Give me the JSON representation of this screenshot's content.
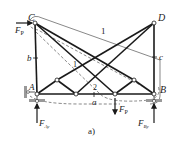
{
  "figure": {
    "caption": "a)",
    "nodes": {
      "C": "C",
      "D": "D",
      "A": "A",
      "B": "B"
    },
    "dimensions": {
      "left_height": "b",
      "right_height": "c",
      "bottom_span": "a"
    },
    "loads": {
      "horizontal_force": "F",
      "horizontal_force_sub": "P",
      "vertical_force": "F",
      "vertical_force_sub": "P",
      "reaction_A": "F",
      "reaction_A_sub": "Ay",
      "reaction_B": "F",
      "reaction_B_sub": "By"
    },
    "sections": {
      "section_1": "1",
      "section_1_inner": "1",
      "section_2": "2"
    },
    "colors": {
      "member": "#1a1a1a",
      "section_line": "#555555",
      "support_hatch": "#888888"
    }
  }
}
